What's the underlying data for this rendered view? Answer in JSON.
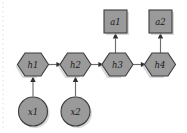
{
  "diagram": {
    "type": "directed-graph",
    "background_color": "#ffffff",
    "node_fill_color": "#9a9a9a",
    "node_stroke_color": "#3d3d3d",
    "edge_color": "#6d6d6d",
    "arrowhead_color": "#2f2f2f",
    "label_color": "#1a1a1a",
    "nodes": [
      {
        "id": "h1",
        "label": "h1",
        "shape": "hexagon",
        "cx": 33,
        "cy": 64.5,
        "rx": 15,
        "ry": 11.5
      },
      {
        "id": "h2",
        "label": "h2",
        "shape": "hexagon",
        "cx": 75.5,
        "cy": 64.5,
        "rx": 15,
        "ry": 11.5
      },
      {
        "id": "h3",
        "label": "h3",
        "shape": "hexagon",
        "cx": 117.5,
        "cy": 64.5,
        "rx": 15,
        "ry": 11.5
      },
      {
        "id": "h4",
        "label": "h4",
        "shape": "hexagon",
        "cx": 160,
        "cy": 64.5,
        "rx": 15,
        "ry": 11.5
      },
      {
        "id": "x1",
        "label": "x1",
        "shape": "circle",
        "cx": 33,
        "cy": 111.5,
        "r": 14.5
      },
      {
        "id": "x2",
        "label": "x2",
        "shape": "circle",
        "cx": 75.5,
        "cy": 111.5,
        "r": 14.5
      },
      {
        "id": "a1",
        "label": "a1",
        "shape": "square",
        "cx": 115.5,
        "cy": 21.5,
        "half": 11.5
      },
      {
        "id": "a2",
        "label": "a2",
        "shape": "square",
        "cx": 160.5,
        "cy": 21.5,
        "half": 11.5
      }
    ],
    "edges": [
      {
        "id": "h1-h2",
        "from": "h1",
        "to": "h2",
        "direction": "right"
      },
      {
        "id": "h2-h3",
        "from": "h2",
        "to": "h3",
        "direction": "right"
      },
      {
        "id": "h3-h4",
        "from": "h3",
        "to": "h4",
        "direction": "right"
      },
      {
        "id": "x1-h1",
        "from": "x1",
        "to": "h1",
        "direction": "up"
      },
      {
        "id": "x2-h2",
        "from": "x2",
        "to": "h2",
        "direction": "up"
      },
      {
        "id": "h3-a1",
        "from": "h3",
        "to": "a1",
        "direction": "up"
      },
      {
        "id": "h4-a2",
        "from": "h4",
        "to": "a2",
        "direction": "up"
      }
    ]
  }
}
